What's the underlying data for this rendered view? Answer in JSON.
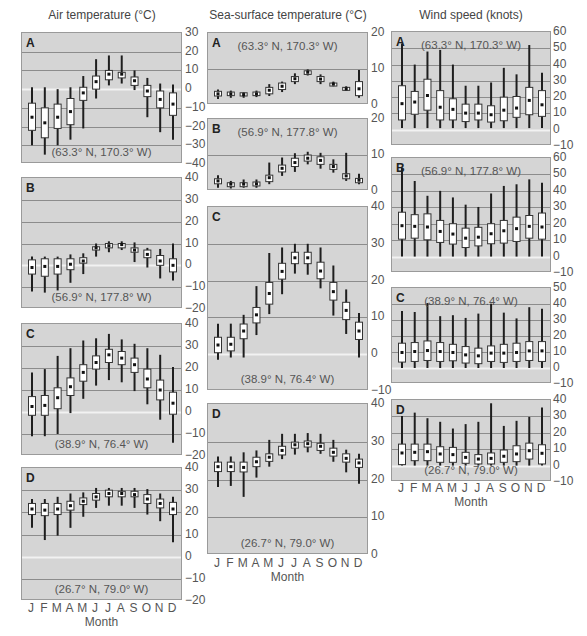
{
  "figure": {
    "columns": [
      {
        "title": "Air temperature (°C)",
        "xlabel": "Month"
      },
      {
        "title": "Sea-surface temperature (°C)",
        "xlabel": "Month"
      },
      {
        "title": "Wind speed (knots)",
        "xlabel": "Month"
      }
    ],
    "months": [
      "J",
      "F",
      "M",
      "A",
      "M",
      "J",
      "J",
      "A",
      "S",
      "O",
      "N",
      "D"
    ],
    "colors": {
      "panel_bg": "#d5d5d5",
      "gridline": "#8c8c8c",
      "zero_line": "#f2f2f2",
      "whisker": "#1e1e1e",
      "box_fill": "#ffffff",
      "box_stroke": "#333333",
      "median": "#111111"
    }
  },
  "chart_data": [
    {
      "type": "box",
      "column": "Air temperature (°C)",
      "panel": "A",
      "location": "(63.3° N, 170.3° W)",
      "xlabel": "Month",
      "ylabel": "Air temperature (°C)",
      "ylim": [
        -40,
        30
      ],
      "yticks": [
        30,
        20,
        10,
        0,
        -10,
        -20,
        -30,
        -40
      ],
      "ytick_labels": [
        "30",
        "20",
        "10",
        "0",
        "−10",
        "−20",
        "−30",
        "−40"
      ],
      "categories": [
        "J",
        "F",
        "M",
        "A",
        "M",
        "J",
        "J",
        "A",
        "S",
        "O",
        "N",
        "D"
      ],
      "whisker_high": [
        1,
        1,
        0,
        1,
        7,
        16,
        18,
        18,
        10,
        6,
        3,
        2.5
      ],
      "q3": [
        -7.5,
        -10,
        -8,
        -5,
        1,
        7,
        10,
        9,
        6.5,
        2,
        -1,
        -2
      ],
      "median": [
        -15,
        -18,
        -15,
        -12,
        -2,
        4,
        8,
        8,
        4.5,
        -1,
        -5.5,
        -8
      ],
      "q1": [
        -22,
        -26,
        -21,
        -19,
        -6,
        0,
        5,
        6,
        2,
        -4,
        -10,
        -14
      ],
      "whisker_low": [
        -30,
        -35,
        -30,
        -27,
        -21,
        -5,
        2,
        3,
        -0.5,
        -15,
        -23,
        -27
      ]
    },
    {
      "type": "box",
      "column": "Air temperature (°C)",
      "panel": "B",
      "location": "(56.9° N, 177.8° W)",
      "xlabel": "Month",
      "ylabel": "Air temperature (°C)",
      "ylim": [
        -20,
        40
      ],
      "yticks": [
        40,
        30,
        20,
        10,
        0,
        -10,
        -20
      ],
      "ytick_labels": [
        "40",
        "30",
        "20",
        "10",
        "0",
        "−10",
        "−20"
      ],
      "categories": [
        "J",
        "F",
        "M",
        "A",
        "M",
        "J",
        "J",
        "A",
        "S",
        "O",
        "N",
        "D"
      ],
      "whisker_high": [
        4,
        4,
        4,
        5,
        5.5,
        10,
        11,
        11,
        10.5,
        8,
        7.5,
        10
      ],
      "q3": [
        2.5,
        3,
        3,
        3,
        3.5,
        8.5,
        10,
        10,
        8,
        7,
        4.5,
        3
      ],
      "median": [
        -1,
        -0.5,
        -0.5,
        0.5,
        2,
        8,
        9,
        9.5,
        7,
        5,
        2,
        0
      ],
      "q1": [
        -4,
        -5,
        -4,
        -2,
        1,
        7,
        8,
        8,
        6,
        3.5,
        0,
        -3
      ],
      "whisker_low": [
        -12,
        -12.5,
        -11.5,
        -8,
        -4,
        4,
        6,
        7,
        1.5,
        -1,
        -6,
        -7
      ]
    },
    {
      "type": "box",
      "column": "Air temperature (°C)",
      "panel": "C",
      "location": "(38.9° N, 76.4° W)",
      "xlabel": "Month",
      "ylabel": "Air temperature (°C)",
      "ylim": [
        -20,
        40
      ],
      "yticks": [
        40,
        30,
        20,
        10,
        0,
        -10,
        -20
      ],
      "ytick_labels": [
        "40",
        "30",
        "20",
        "10",
        "0",
        "−10",
        "−20"
      ],
      "categories": [
        "J",
        "F",
        "M",
        "A",
        "M",
        "J",
        "J",
        "A",
        "S",
        "O",
        "N",
        "D"
      ],
      "whisker_high": [
        18,
        19.5,
        25.5,
        29,
        32.5,
        33.5,
        35.5,
        33,
        31,
        29,
        26,
        20.5
      ],
      "q3": [
        7,
        7.5,
        11,
        15.5,
        21.5,
        25.5,
        28.5,
        27.5,
        24.5,
        19.5,
        14.5,
        9
      ],
      "median": [
        2.5,
        3,
        6.5,
        11.5,
        18,
        22.5,
        26,
        24.5,
        21.5,
        15,
        10,
        4
      ],
      "q1": [
        -1.5,
        -1.5,
        1.5,
        7.5,
        14,
        19.5,
        22.5,
        21.5,
        18,
        11,
        5.5,
        -1
      ],
      "whisker_low": [
        -11,
        -11,
        -10,
        -0.5,
        6,
        12,
        14.5,
        13.5,
        9.5,
        3.5,
        -3.5,
        -14
      ]
    },
    {
      "type": "box",
      "column": "Air temperature (°C)",
      "panel": "D",
      "location": "(26.7° N, 79.0° W)",
      "xlabel": "Month",
      "ylabel": "Air temperature (°C)",
      "ylim": [
        -20,
        40
      ],
      "yticks": [
        40,
        30,
        20,
        10,
        0,
        -10,
        -20
      ],
      "ytick_labels": [
        "40",
        "30",
        "20",
        "10",
        "0",
        "−10",
        "−20"
      ],
      "categories": [
        "J",
        "F",
        "M",
        "A",
        "M",
        "J",
        "J",
        "A",
        "S",
        "O",
        "N",
        "D"
      ],
      "whisker_high": [
        26,
        26,
        27,
        28.5,
        29,
        31,
        31,
        31,
        31,
        30.5,
        28.5,
        27
      ],
      "q3": [
        24,
        24,
        24,
        25,
        26.5,
        28.5,
        30,
        29.5,
        29.5,
        28,
        26,
        24.5
      ],
      "median": [
        21.5,
        21,
        21.5,
        23,
        25,
        27,
        28.5,
        28.5,
        28,
        26,
        24,
        21.5
      ],
      "q1": [
        19,
        18.5,
        19,
        21,
        23.5,
        25.5,
        27,
        27,
        27,
        24,
        22,
        19
      ],
      "whisker_low": [
        13,
        7.5,
        9.5,
        13,
        18,
        22,
        23,
        23,
        22,
        19,
        16,
        6.5
      ]
    },
    {
      "type": "box",
      "column": "Sea-surface temperature (°C)",
      "panel": "A",
      "location": "(63.3° N, 170.3° W)",
      "xlabel": "Month",
      "ylabel": "Sea-surface temperature (°C)",
      "ylim": [
        0,
        20
      ],
      "yticks": [
        20,
        10,
        0
      ],
      "ytick_labels": [
        "20",
        "10",
        "0"
      ],
      "categories": [
        "J",
        "F",
        "M",
        "A",
        "M",
        "J",
        "J",
        "A",
        "S",
        "O",
        "N",
        "D"
      ],
      "whisker_high": [
        4.3,
        4,
        3.6,
        4,
        5.8,
        6.5,
        8.8,
        9.9,
        8.5,
        6.5,
        5.2,
        9.7
      ],
      "q3": [
        3.8,
        3.6,
        3.4,
        3.6,
        4.9,
        6.1,
        7.9,
        9.5,
        7.9,
        6.1,
        4.9,
        6.5
      ],
      "median": [
        3.1,
        3.1,
        2.9,
        3.1,
        4.1,
        5.2,
        7.3,
        9.1,
        7.2,
        5.8,
        4.5,
        4.5
      ],
      "q1": [
        2.5,
        2.6,
        2.5,
        2.6,
        3.1,
        4.3,
        6.5,
        8.5,
        6.5,
        5.5,
        4.3,
        2.6
      ],
      "whisker_low": [
        1.7,
        2,
        2,
        2.2,
        2.5,
        3.6,
        5.8,
        8.2,
        5.8,
        5.2,
        4,
        2
      ]
    },
    {
      "type": "box",
      "column": "Sea-surface temperature (°C)",
      "panel": "B",
      "location": "(56.9° N, 177.8° W)",
      "xlabel": "Month",
      "ylabel": "Sea-surface temperature (°C)",
      "ylim": [
        0,
        20
      ],
      "yticks": [
        20,
        10,
        0
      ],
      "ytick_labels": [
        "20",
        "10",
        "0"
      ],
      "categories": [
        "J",
        "F",
        "M",
        "A",
        "M",
        "J",
        "J",
        "A",
        "S",
        "O",
        "N",
        "D"
      ],
      "whisker_high": [
        4.4,
        2.8,
        3.2,
        3.2,
        7.9,
        9.3,
        10.5,
        10.9,
        10.6,
        8.8,
        10.6,
        4.8
      ],
      "q3": [
        3.4,
        2.3,
        2.3,
        2.5,
        4.4,
        7.2,
        9.1,
        10,
        9.5,
        7.4,
        4.8,
        3.5
      ],
      "median": [
        2.8,
        1.9,
        1.9,
        2,
        3.7,
        6.3,
        7.9,
        9.1,
        8.5,
        6.8,
        4.2,
        3
      ],
      "q1": [
        2,
        1.2,
        1.2,
        1.4,
        2.6,
        5.3,
        6.8,
        8.3,
        7.4,
        6,
        3.4,
        2.3
      ],
      "whisker_low": [
        0.9,
        0.7,
        0.9,
        0.9,
        1.9,
        4.2,
        5.3,
        7.4,
        6.2,
        5.1,
        2.8,
        1.9
      ]
    },
    {
      "type": "box",
      "column": "Sea-surface temperature (°C)",
      "panel": "C",
      "location": "(38.9° N, 76.4° W)",
      "xlabel": "Month",
      "ylabel": "Sea-surface temperature (°C)",
      "ylim": [
        -10,
        40
      ],
      "yticks": [
        40,
        30,
        20,
        10,
        0,
        -10
      ],
      "ytick_labels": [
        "40",
        "30",
        "20",
        "10",
        "0",
        "−10"
      ],
      "categories": [
        "J",
        "F",
        "M",
        "A",
        "M",
        "J",
        "J",
        "A",
        "S",
        "O",
        "N",
        "D"
      ],
      "whisker_high": [
        8.3,
        8.3,
        10.7,
        18.5,
        27.5,
        29,
        30,
        30,
        29,
        24.1,
        17.6,
        11.2
      ],
      "q3": [
        4.6,
        4.6,
        8.2,
        12.7,
        19.5,
        24.7,
        27.7,
        27.7,
        25,
        19.5,
        14.1,
        8.7
      ],
      "median": [
        2.5,
        2.7,
        6.3,
        10.7,
        16.5,
        22.5,
        26.2,
        26.2,
        22.6,
        17,
        11.9,
        6.3
      ],
      "q1": [
        0.4,
        0.9,
        4.2,
        8.5,
        13.6,
        20.4,
        24.6,
        24.6,
        20.5,
        14.7,
        9.4,
        4
      ],
      "whisker_low": [
        -1.5,
        -0.9,
        -0.9,
        5.2,
        10.9,
        16.3,
        21.9,
        21.6,
        17.9,
        10.5,
        5.5,
        -0.9
      ]
    },
    {
      "type": "box",
      "column": "Sea-surface temperature (°C)",
      "panel": "D",
      "location": "(26.7° N, 79.0° W)",
      "xlabel": "Month",
      "ylabel": "Sea-surface temperature (°C)",
      "ylim": [
        0,
        40
      ],
      "yticks": [
        40,
        30,
        20,
        10,
        0
      ],
      "ytick_labels": [
        "40",
        "30",
        "20",
        "10",
        "0"
      ],
      "categories": [
        "J",
        "F",
        "M",
        "A",
        "M",
        "J",
        "J",
        "A",
        "S",
        "O",
        "N",
        "D"
      ],
      "whisker_high": [
        26.1,
        26.1,
        27.2,
        27.7,
        30.5,
        32.1,
        32.1,
        32.3,
        32.1,
        30.5,
        27.9,
        26.8
      ],
      "q3": [
        24.6,
        24.6,
        24.6,
        25.9,
        26.8,
        28.8,
        29.9,
        30.2,
        29.6,
        28.3,
        26.8,
        25.4
      ],
      "median": [
        23.4,
        23.4,
        23.2,
        24.7,
        25.9,
        27.7,
        29.2,
        29.5,
        28.8,
        27.2,
        25.6,
        24.4
      ],
      "q1": [
        22.1,
        22.1,
        22,
        23.4,
        24.8,
        26.5,
        28.3,
        28.6,
        27.7,
        26.2,
        24.6,
        23.2
      ],
      "whisker_low": [
        18,
        18.3,
        15.4,
        20.5,
        23.4,
        25.4,
        26.6,
        27.2,
        26.8,
        24.7,
        21.9,
        18.9
      ]
    },
    {
      "type": "box",
      "column": "Wind speed (knots)",
      "panel": "A",
      "location": "(63.3° N, 170.3° W)",
      "xlabel": "Month",
      "ylabel": "Wind speed (knots)",
      "ylim": [
        -10,
        60
      ],
      "yticks": [
        60,
        50,
        40,
        30,
        20,
        10,
        0,
        -10
      ],
      "ytick_labels": [
        "60",
        "50",
        "40",
        "30",
        "20",
        "10",
        "0",
        "−10"
      ],
      "categories": [
        "J",
        "F",
        "M",
        "A",
        "M",
        "J",
        "J",
        "A",
        "S",
        "O",
        "N",
        "D"
      ],
      "whisker_high": [
        53,
        40,
        48,
        49,
        40,
        27,
        27,
        29,
        38,
        34,
        52,
        35
      ],
      "q3": [
        27,
        23.5,
        31,
        24,
        19,
        15.7,
        15.7,
        14.7,
        20,
        20.4,
        26,
        24
      ],
      "median": [
        16,
        17,
        21,
        13.8,
        12.5,
        10.2,
        10.2,
        9.2,
        12,
        13.3,
        18,
        15.3
      ],
      "q1": [
        6,
        9.5,
        12,
        6,
        6,
        5,
        6,
        4.7,
        5.5,
        7.6,
        9.2,
        8.2
      ],
      "whisker_low": [
        1,
        1,
        1,
        1,
        1,
        1,
        1,
        1,
        1,
        1,
        1,
        1
      ]
    },
    {
      "type": "box",
      "column": "Wind speed (knots)",
      "panel": "B",
      "location": "(56.9° N, 177.8° W)",
      "xlabel": "Month",
      "ylabel": "Wind speed (knots)",
      "ylim": [
        -10,
        60
      ],
      "yticks": [
        60,
        50,
        40,
        30,
        20,
        10,
        0,
        -10
      ],
      "ytick_labels": [
        "60",
        "50",
        "40",
        "30",
        "20",
        "10",
        "0",
        "−10"
      ],
      "categories": [
        "J",
        "F",
        "M",
        "A",
        "M",
        "J",
        "J",
        "A",
        "S",
        "O",
        "N",
        "D"
      ],
      "whisker_high": [
        54,
        46,
        37,
        40,
        36,
        31.6,
        30.2,
        38.4,
        43,
        44,
        47,
        45
      ],
      "q3": [
        27,
        25.5,
        26,
        22,
        20,
        17.3,
        17.8,
        20,
        22,
        24,
        25,
        26.5
      ],
      "median": [
        18.8,
        18.4,
        18,
        15.3,
        13.7,
        11.2,
        11.8,
        13.9,
        15.7,
        17,
        18.4,
        18
      ],
      "q1": [
        10.6,
        11.2,
        10.2,
        8.6,
        7.6,
        5.5,
        6.5,
        7.8,
        8.2,
        9.2,
        11.2,
        10.6
      ],
      "whisker_low": [
        0,
        0,
        0,
        0,
        0,
        0,
        0,
        0,
        0,
        0,
        0,
        0
      ]
    },
    {
      "type": "box",
      "column": "Wind speed (knots)",
      "panel": "C",
      "location": "(38.9° N, 76.4° W)",
      "xlabel": "Month",
      "ylabel": "Wind speed (knots)",
      "ylim": [
        -10,
        50
      ],
      "yticks": [
        50,
        40,
        30,
        20,
        10,
        0,
        -10
      ],
      "ytick_labels": [
        "50",
        "40",
        "30",
        "20",
        "10",
        "0",
        "−10"
      ],
      "categories": [
        "J",
        "F",
        "M",
        "A",
        "M",
        "J",
        "J",
        "A",
        "S",
        "O",
        "N",
        "D"
      ],
      "whisker_high": [
        35.7,
        35,
        40.6,
        32.4,
        33,
        31.3,
        34,
        40.2,
        34.6,
        31,
        38,
        37
      ],
      "q3": [
        15.5,
        15.9,
        16.9,
        15.9,
        14.8,
        13.4,
        12.4,
        13.8,
        14.8,
        15.5,
        16.5,
        16.5
      ],
      "median": [
        9.7,
        10.3,
        10.9,
        10.3,
        9.7,
        8.2,
        7.6,
        9.3,
        9.3,
        9.7,
        10.7,
        10.7
      ],
      "q1": [
        3.7,
        4.1,
        4.7,
        4.1,
        4.5,
        3.1,
        2.7,
        4.1,
        3.5,
        4.1,
        4.7,
        4.1
      ],
      "whisker_low": [
        0,
        0,
        0,
        0,
        0,
        0,
        0,
        0,
        0,
        0,
        0,
        0
      ]
    },
    {
      "type": "box",
      "column": "Wind speed (knots)",
      "panel": "D",
      "location": "(26.7° N, 79.0° W)",
      "xlabel": "Month",
      "ylabel": "Wind speed (knots)",
      "ylim": [
        -10,
        40
      ],
      "yticks": [
        40,
        30,
        20,
        10,
        0,
        -10
      ],
      "ytick_labels": [
        "40",
        "30",
        "20",
        "10",
        "0",
        "−10"
      ],
      "categories": [
        "J",
        "F",
        "M",
        "A",
        "M",
        "J",
        "J",
        "A",
        "S",
        "O",
        "N",
        "D"
      ],
      "whisker_high": [
        30.3,
        32.3,
        28.9,
        26.7,
        22.6,
        25.3,
        26.7,
        38,
        24.2,
        27.3,
        29.7,
        35.4
      ],
      "q3": [
        13.1,
        13.1,
        13.1,
        11.5,
        11.1,
        8.1,
        6.7,
        7.7,
        9.5,
        12.1,
        13.7,
        12.7
      ],
      "median": [
        7.7,
        8.1,
        8.5,
        7.1,
        6.7,
        5,
        4,
        4.4,
        5.7,
        7.1,
        9.1,
        7.5
      ],
      "q1": [
        0.6,
        3,
        3,
        2,
        2,
        1.4,
        1,
        1,
        2,
        2.4,
        4,
        1
      ],
      "whisker_low": [
        0,
        0,
        0,
        0,
        0,
        0,
        0,
        0,
        0,
        0,
        0,
        0
      ]
    }
  ]
}
